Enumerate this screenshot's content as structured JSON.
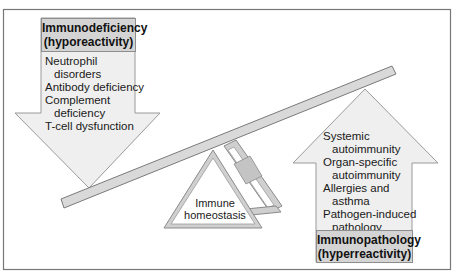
{
  "diagram": {
    "colors": {
      "arrow_fill": "#efefef",
      "arrow_stroke": "#9a9a9a",
      "header_fill": "#d4d4d4",
      "beam_fill": "#d9d9d9",
      "frame_stroke": "#777777"
    },
    "hypo": {
      "header_line1": "Immunodeficiency",
      "header_line2": "(hyporeactivity)",
      "direction": "down",
      "items": [
        {
          "line1": "Neutrophil",
          "line2": "disorders"
        },
        {
          "line1": "Antibody deficiency",
          "line2": ""
        },
        {
          "line1": "Complement",
          "line2": "deficiency"
        },
        {
          "line1": "T-cell dysfunction",
          "line2": ""
        }
      ]
    },
    "hyper": {
      "header_line1": "Immunopathology",
      "header_line2": "(hyperreactivity)",
      "direction": "up",
      "items": [
        {
          "line1": "Systemic",
          "line2": "autoimmunity"
        },
        {
          "line1": "Organ-specific",
          "line2": "autoimmunity"
        },
        {
          "line1": "Allergies and",
          "line2": "asthma"
        },
        {
          "line1": "Pathogen-induced",
          "line2": "pathology"
        }
      ]
    },
    "fulcrum": {
      "line1": "Immune",
      "line2": "homeostasis"
    }
  }
}
